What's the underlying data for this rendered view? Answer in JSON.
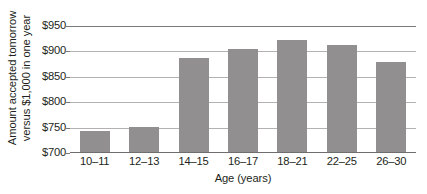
{
  "chart_data": {
    "type": "bar",
    "title": "",
    "subtitle": "",
    "xlabel": "Age (years)",
    "ylabel": "Amount accepted tomorrow versus $1,000 in one year",
    "ylabel_lines": [
      "Amount accepted tomorrow",
      "versus $1,000 in one year"
    ],
    "categories": [
      "10–11",
      "12–13",
      "14–15",
      "16–17",
      "18–21",
      "22–25",
      "26–30"
    ],
    "values": [
      743,
      752,
      887,
      905,
      922,
      913,
      879
    ],
    "ylim": [
      700,
      950
    ],
    "yticks": [
      700,
      750,
      800,
      850,
      900,
      950
    ],
    "ytick_labels": [
      "$700",
      "$750",
      "$800",
      "$850",
      "$900",
      "$950"
    ],
    "grid": true,
    "grid_axis": "y",
    "legend": false,
    "legend_position": "none",
    "bar_color": "#918f90",
    "gridline_color": "#b3b1b2",
    "axis_color": "#6f6d6e",
    "background_color": "#ffffff",
    "text_color": "#231f20"
  }
}
